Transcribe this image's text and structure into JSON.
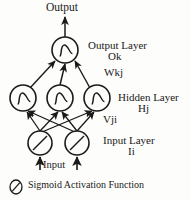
{
  "figure": {
    "type": "neural-network-diagram",
    "title_top": "Output",
    "bottom_input_label": "Input",
    "ink_color": "#1a1a1a",
    "background_color": "#fdfdfb"
  },
  "labels": {
    "output_top": "Output",
    "output_layer": "Output Layer",
    "output_symbol": "Ok",
    "weights_hidden_to_output": "Wkj",
    "hidden_layer": "Hidden Layer",
    "hidden_symbol": "Hj",
    "weights_input_to_hidden": "Vji",
    "input_layer": "Input Layer",
    "input_symbol": "Ii",
    "input_bottom": "Input"
  },
  "legend": {
    "icon": "sigmoid-circle-icon",
    "text": "Sigmoid Activation Function"
  },
  "network": {
    "layers": [
      {
        "name": "input-layer",
        "symbol": "Ii",
        "node_glyph": "diagonal-line",
        "node_count": 2,
        "nodes": [
          {
            "id": "i1",
            "cx": 40,
            "cy": 143,
            "r": 12
          },
          {
            "id": "i2",
            "cx": 77,
            "cy": 143,
            "r": 12
          }
        ]
      },
      {
        "name": "hidden-layer",
        "symbol": "Hj",
        "node_glyph": "sigmoid-curve",
        "node_count": 3,
        "nodes": [
          {
            "id": "h1",
            "cx": 23,
            "cy": 98,
            "r": 13
          },
          {
            "id": "h2",
            "cx": 60,
            "cy": 98,
            "r": 13
          },
          {
            "id": "h3",
            "cx": 97,
            "cy": 98,
            "r": 13
          }
        ]
      },
      {
        "name": "output-layer",
        "symbol": "Ok",
        "node_glyph": "sigmoid-curve",
        "node_count": 1,
        "nodes": [
          {
            "id": "o1",
            "cx": 65,
            "cy": 50,
            "r": 13
          }
        ]
      }
    ],
    "connections": {
      "input_to_hidden": [
        {
          "from": "i1",
          "to": "h1"
        },
        {
          "from": "i1",
          "to": "h2"
        },
        {
          "from": "i1",
          "to": "h3"
        },
        {
          "from": "i2",
          "to": "h1"
        },
        {
          "from": "i2",
          "to": "h2"
        },
        {
          "from": "i2",
          "to": "h3"
        }
      ],
      "hidden_to_output": [
        {
          "from": "h1",
          "to": "o1"
        },
        {
          "from": "h2",
          "to": "o1"
        },
        {
          "from": "h3",
          "to": "o1"
        }
      ],
      "external_inputs": [
        {
          "to": "i1"
        },
        {
          "to": "i2"
        }
      ],
      "external_output": [
        {
          "from": "o1"
        }
      ]
    }
  }
}
